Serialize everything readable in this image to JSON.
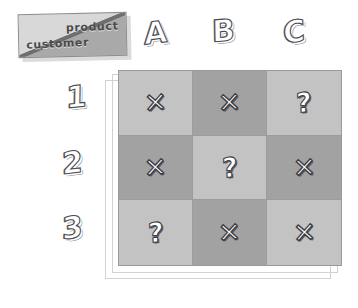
{
  "diagram": {
    "corner": {
      "top_right_label": "product",
      "bottom_left_label": "customer"
    },
    "columns": [
      "A",
      "B",
      "C"
    ],
    "rows": [
      "1",
      "2",
      "3"
    ],
    "cells": [
      [
        {
          "mark": "x",
          "shade": "light"
        },
        {
          "mark": "x",
          "shade": "dark"
        },
        {
          "mark": "?",
          "shade": "light"
        }
      ],
      [
        {
          "mark": "x",
          "shade": "dark"
        },
        {
          "mark": "?",
          "shade": "light"
        },
        {
          "mark": "x",
          "shade": "dark"
        }
      ],
      [
        {
          "mark": "?",
          "shade": "light"
        },
        {
          "mark": "x",
          "shade": "dark"
        },
        {
          "mark": "x",
          "shade": "light"
        }
      ]
    ],
    "colors": {
      "cell_light": "#c3c3c3",
      "cell_dark": "#a2a2a2",
      "grid_line": "#9c9c9c",
      "mark_fill": "#ffffff",
      "mark_outline": "#3e3e44",
      "corner_upper": "#d8d8d8",
      "corner_lower": "#a9a9a9",
      "background": "#ffffff"
    }
  }
}
